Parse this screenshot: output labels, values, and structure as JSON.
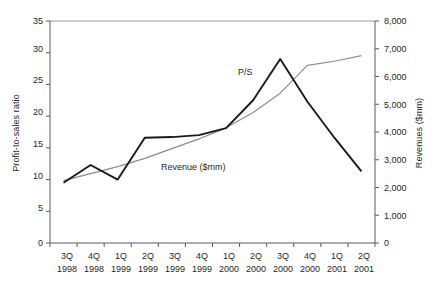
{
  "chart_data": {
    "type": "line",
    "title": "",
    "xlabel": "",
    "grid": false,
    "legend_position": "inline-annotations",
    "categories": [
      "3Q 1998",
      "4Q 1998",
      "1Q 1999",
      "2Q 1999",
      "3Q 1999",
      "4Q 1999",
      "1Q 2000",
      "2Q 2000",
      "3Q 2000",
      "4Q 2000",
      "1Q 2001",
      "2Q 2001"
    ],
    "x_tick_quarters": [
      "3Q",
      "4Q",
      "1Q",
      "2Q",
      "3Q",
      "4Q",
      "1Q",
      "2Q",
      "3Q",
      "4Q",
      "1Q",
      "2Q"
    ],
    "x_tick_years": [
      "1998",
      "1998",
      "1999",
      "1999",
      "1999",
      "1999",
      "2000",
      "2000",
      "2000",
      "2000",
      "2001",
      "2001"
    ],
    "left_axis": {
      "label": "Profit-to-sales ratio",
      "ticks": [
        "0",
        "5",
        "10",
        "15",
        "20",
        "25",
        "30",
        "35"
      ],
      "tick_values": [
        0,
        5,
        10,
        15,
        20,
        25,
        30,
        35
      ],
      "ylim": [
        0,
        35
      ]
    },
    "right_axis": {
      "label": "Revenues ($mm)",
      "ticks": [
        "0",
        "1,000",
        "2,000",
        "3,000",
        "4,000",
        "5,000",
        "6,000",
        "7,000",
        "8,000"
      ],
      "tick_values": [
        0,
        1000,
        2000,
        3000,
        4000,
        5000,
        6000,
        7000,
        8000
      ],
      "ylim": [
        0,
        8000
      ]
    },
    "series": [
      {
        "name": "P/S",
        "annotation": "P/S",
        "axis": "left",
        "color": "#1a1a1a",
        "width": 1.9,
        "values": [
          9.5,
          12.3,
          10.0,
          16.6,
          16.7,
          17.0,
          18.1,
          22.5,
          29.0,
          22.3,
          16.6,
          11.3
        ]
      },
      {
        "name": "Revenue ($mm)",
        "annotation": "Revenue ($mm)",
        "axis": "right",
        "color": "#8c8c8c",
        "width": 1.2,
        "values": [
          2250,
          2500,
          2750,
          3050,
          3400,
          3750,
          4150,
          4700,
          5400,
          6400,
          6550,
          6750
        ]
      }
    ]
  },
  "annotations": {
    "ps_label": "P/S",
    "revenue_label": "Revenue ($mm)"
  }
}
